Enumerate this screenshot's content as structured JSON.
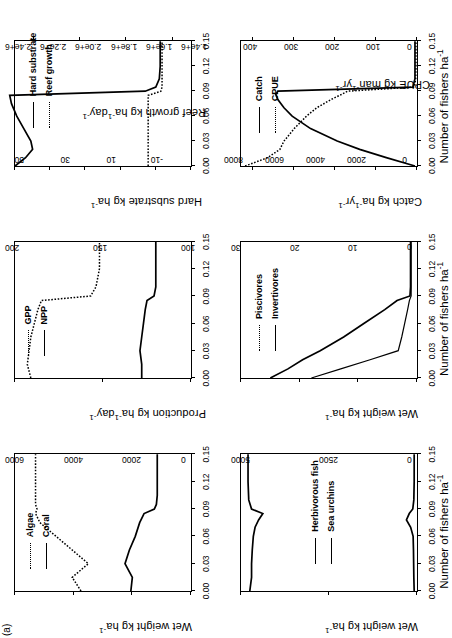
{
  "figure": {
    "panel_tag": "(a)",
    "xlabel": "Number of fishers ha",
    "xlabel_sup": "-1",
    "xticks": [
      "0.00",
      "0.03",
      "0.06",
      "0.09",
      "0.12",
      "0.15"
    ]
  },
  "chart_data": [
    {
      "id": "algae-coral",
      "type": "line",
      "title": "",
      "xlabel": "Number of fishers ha^-1",
      "ylabel": "Wet weight kg ha^-1",
      "xlim": [
        0.0,
        0.15
      ],
      "ylim": [
        0,
        6000
      ],
      "yticks": [
        0,
        2000,
        4000,
        6000
      ],
      "ytick_labels": [
        "0",
        "2000",
        "4000",
        "6000"
      ],
      "grid": false,
      "legend_position": "top-left",
      "series": [
        {
          "name": "Algae",
          "style": "dotted",
          "x": [
            0.0,
            0.015,
            0.03,
            0.045,
            0.06,
            0.075,
            0.085,
            0.09,
            0.095,
            0.105,
            0.12,
            0.135,
            0.15
          ],
          "values": [
            3750,
            4050,
            3500,
            4050,
            4600,
            5150,
            5300,
            5250,
            5300,
            5300,
            5300,
            5300,
            5300
          ]
        },
        {
          "name": "Coral",
          "style": "solid",
          "x": [
            0.0,
            0.015,
            0.03,
            0.045,
            0.06,
            0.075,
            0.085,
            0.09,
            0.095,
            0.105,
            0.12,
            0.135,
            0.15
          ],
          "values": [
            2050,
            2000,
            2250,
            2100,
            1900,
            1750,
            1600,
            1250,
            1180,
            1150,
            1150,
            1150,
            1150
          ]
        }
      ]
    },
    {
      "id": "herbivores-urchins",
      "type": "line",
      "xlabel": "Number of fishers ha^-1",
      "ylabel": "Wet weight kg ha^-1",
      "xlim": [
        0.0,
        0.15
      ],
      "ylim": [
        0,
        5000
      ],
      "yticks": [
        0,
        2500,
        5000
      ],
      "ytick_labels": [
        "0",
        "2500",
        "5000"
      ],
      "grid": false,
      "legend_position": "center",
      "series": [
        {
          "name": "Herbivorous fish",
          "style": "solid",
          "x": [
            0.0,
            0.015,
            0.03,
            0.045,
            0.06,
            0.07,
            0.078,
            0.085,
            0.09,
            0.1,
            0.12,
            0.14,
            0.15
          ],
          "values": [
            4750,
            4700,
            4700,
            4680,
            4650,
            4600,
            4500,
            4380,
            4700,
            4780,
            4800,
            4800,
            4800
          ]
        },
        {
          "name": "Sea urchins",
          "style": "solid",
          "x": [
            0.0,
            0.015,
            0.03,
            0.045,
            0.06,
            0.07,
            0.078,
            0.085,
            0.09,
            0.1,
            0.12,
            0.14,
            0.15
          ],
          "values": [
            80,
            90,
            95,
            100,
            110,
            180,
            300,
            220,
            120,
            90,
            80,
            80,
            80
          ]
        }
      ]
    },
    {
      "id": "piscivores-invertivores",
      "type": "line",
      "xlabel": "Number of fishers ha^-1",
      "ylabel": "Wet weight kg ha^-1",
      "xlim": [
        0.0,
        0.15
      ],
      "ylim": [
        0,
        30
      ],
      "yticks": [
        0,
        10,
        20,
        30
      ],
      "ytick_labels": [
        "0",
        "10",
        "20",
        "30"
      ],
      "grid": false,
      "legend_position": "top-left",
      "series": [
        {
          "name": "Piscivores",
          "style": "dotted",
          "x": [
            0.0,
            0.01,
            0.02,
            0.03,
            0.045,
            0.06,
            0.075,
            0.085,
            0.09,
            0.1,
            0.12,
            0.14,
            0.15
          ],
          "values": [
            18.0,
            13.0,
            8.0,
            3.2,
            2.6,
            2.1,
            1.6,
            1.3,
            1.0,
            1.0,
            1.0,
            1.0,
            1.0
          ]
        },
        {
          "name": "Invertivores",
          "style": "solid",
          "x": [
            0.0,
            0.01,
            0.02,
            0.03,
            0.045,
            0.06,
            0.075,
            0.085,
            0.09,
            0.1,
            0.12,
            0.14,
            0.15
          ],
          "values": [
            25.0,
            22.0,
            19.5,
            16.5,
            12.5,
            9.0,
            5.5,
            3.4,
            1.2,
            1.1,
            1.1,
            1.1,
            1.1
          ]
        }
      ]
    },
    {
      "id": "gpp-npp",
      "type": "line",
      "xlabel": "Number of fishers ha^-1",
      "ylabel": "Production kg ha^-1 day^-1",
      "xlim": [
        0.0,
        0.15
      ],
      "ylim": [
        100,
        200
      ],
      "yticks": [
        100,
        150,
        200
      ],
      "ytick_labels": [
        "100",
        "150",
        "200"
      ],
      "grid": false,
      "legend_position": "top-left",
      "series": [
        {
          "name": "GPP",
          "style": "dotted",
          "x": [
            0.0,
            0.015,
            0.03,
            0.045,
            0.06,
            0.075,
            0.085,
            0.09,
            0.1,
            0.12,
            0.14,
            0.15
          ],
          "values": [
            191,
            193,
            192,
            191,
            189,
            187,
            185,
            157,
            154,
            152,
            152,
            152
          ]
        },
        {
          "name": "NPP",
          "style": "solid",
          "x": [
            0.0,
            0.015,
            0.03,
            0.045,
            0.06,
            0.075,
            0.085,
            0.09,
            0.1,
            0.12,
            0.14,
            0.15
          ],
          "values": [
            128,
            128,
            129,
            128,
            127,
            126,
            125,
            121,
            120,
            120,
            120,
            120
          ]
        }
      ]
    },
    {
      "id": "hardsubstrate-reefgrowth",
      "type": "line",
      "xlabel": "Number of fishers ha^-1",
      "ylabel_left": "Hard substrate kg ha^-1",
      "ylabel_right": "Reef growth kg ha^-1 day^-1",
      "xlim": [
        0.0,
        0.15
      ],
      "ylim_left": [
        1400000,
        2400000
      ],
      "yticks_left": [
        1400000,
        1600000,
        1800000,
        2000000,
        2200000,
        2400000
      ],
      "ytick_labels_left": [
        "1.4e+6",
        "1.6e+6",
        "1.8e+6",
        "2.0e+6",
        "2.2e+6",
        "2.4e+6"
      ],
      "ylim_right": [
        -18,
        58
      ],
      "yticks_right": [
        -10,
        10,
        30,
        50
      ],
      "ytick_labels_right": [
        "-10",
        "10",
        "30",
        "50"
      ],
      "grid": false,
      "legend_position": "top-center",
      "series": [
        {
          "name": "Hard substrate",
          "axis": "left",
          "style": "solid",
          "x": [
            0.0,
            0.01,
            0.02,
            0.03,
            0.045,
            0.06,
            0.075,
            0.085,
            0.09,
            0.095,
            0.105,
            0.12,
            0.14,
            0.15
          ],
          "values": [
            2400000,
            2340000,
            2300000,
            2310000,
            2350000,
            2390000,
            2420000,
            2430000,
            1660000,
            1600000,
            1580000,
            1575000,
            1575000,
            1575000
          ]
        },
        {
          "name": "Reef growth",
          "axis": "right",
          "style": "dotted",
          "x": [
            0.0,
            0.01,
            0.02,
            0.03,
            0.045,
            0.06,
            0.075,
            0.085,
            0.09,
            0.095,
            0.105,
            0.12,
            0.14,
            0.15
          ],
          "values": [
            0.5,
            0.5,
            0.5,
            0.5,
            0.5,
            0.5,
            0.5,
            0.5,
            -5.0,
            -5.5,
            -5.5,
            -5.5,
            -5.5,
            -5.5
          ]
        }
      ]
    },
    {
      "id": "catch-cpue",
      "type": "line",
      "xlabel": "Number of fishers ha^-1",
      "ylabel_left": "Catch kg ha^-1 yr^-1",
      "ylabel_right": "CPUE kg man^-1 yr^-1",
      "xlim": [
        0.0,
        0.15
      ],
      "ylim_left": [
        0,
        430
      ],
      "yticks_left": [
        0,
        100,
        200,
        300,
        400
      ],
      "ytick_labels_left": [
        "0",
        "100",
        "200",
        "300",
        "400"
      ],
      "ylim_right": [
        0,
        8600
      ],
      "yticks_right": [
        0,
        2000,
        4000,
        6000,
        8000
      ],
      "ytick_labels_right": [
        "0",
        "2000",
        "4000",
        "6000",
        "8000"
      ],
      "grid": false,
      "legend_position": "top-center",
      "series": [
        {
          "name": "Catch",
          "axis": "left",
          "style": "solid",
          "x": [
            0.0,
            0.01,
            0.02,
            0.03,
            0.045,
            0.06,
            0.07,
            0.08,
            0.086,
            0.09,
            0.095,
            0.105,
            0.12,
            0.14,
            0.15
          ],
          "values": [
            5,
            75,
            140,
            195,
            260,
            305,
            325,
            340,
            345,
            340,
            10,
            5,
            5,
            5,
            5
          ]
        },
        {
          "name": "CPUE",
          "axis": "right",
          "style": "dotted",
          "x": [
            0.0,
            0.01,
            0.02,
            0.03,
            0.045,
            0.06,
            0.07,
            0.08,
            0.086,
            0.09,
            0.095,
            0.105,
            0.12,
            0.14,
            0.15
          ],
          "values": [
            8400,
            7300,
            6700,
            6500,
            6000,
            5400,
            4900,
            4200,
            3700,
            3400,
            130,
            60,
            50,
            50,
            50
          ]
        }
      ]
    }
  ]
}
